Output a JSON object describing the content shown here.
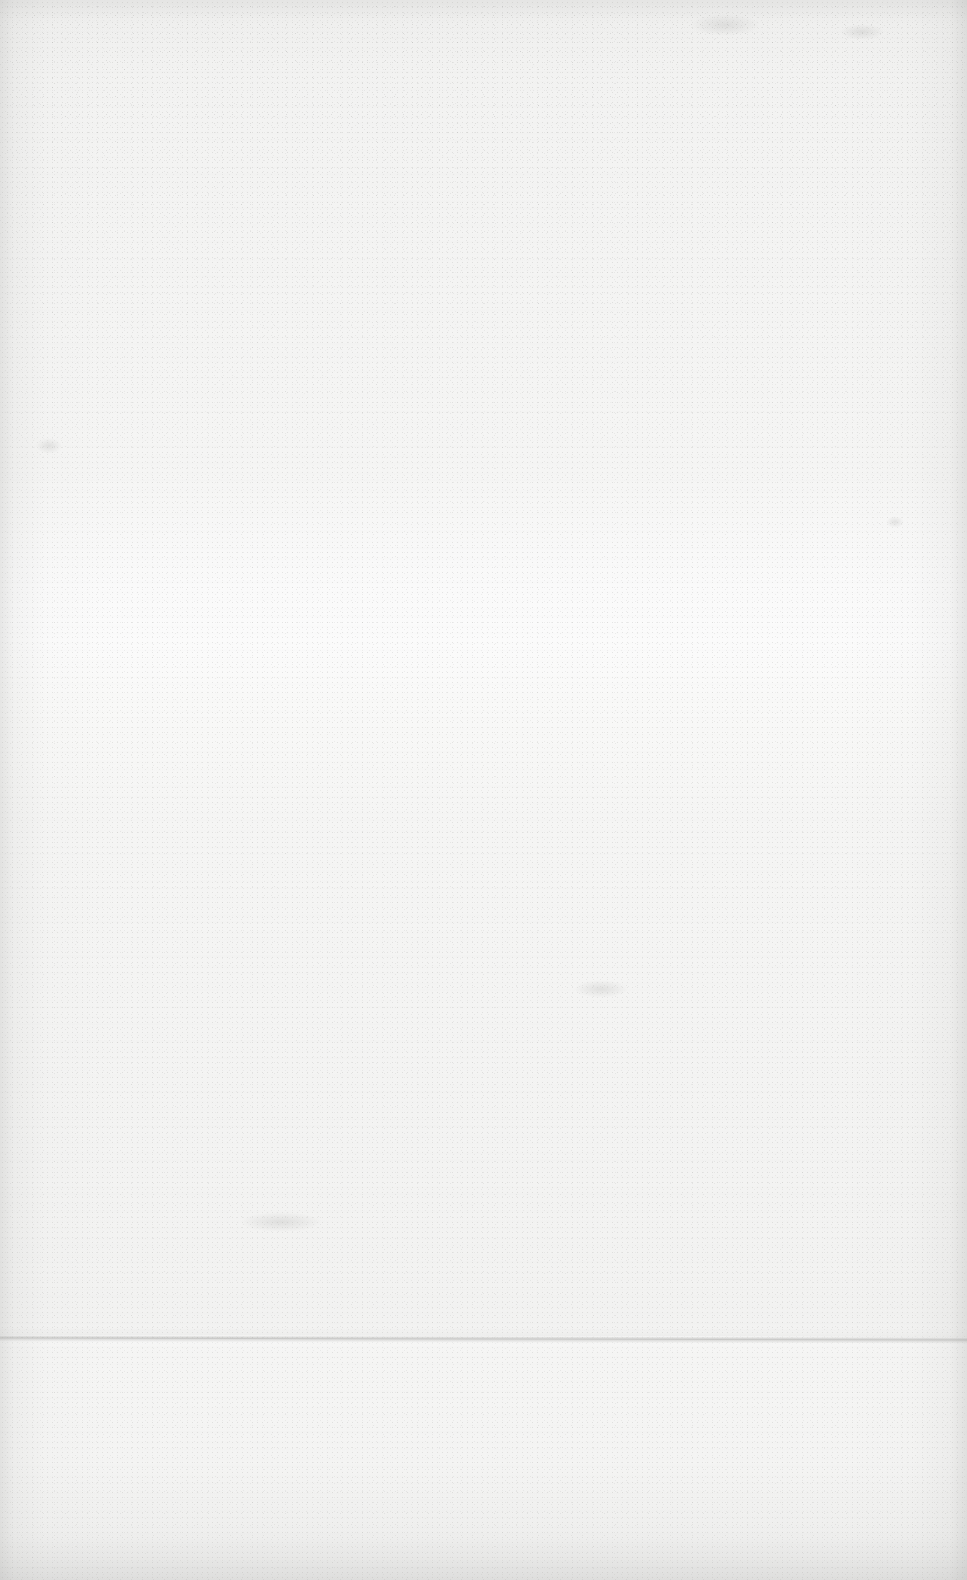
{
  "page": {
    "kind": "scanned-blank-page",
    "width": 967,
    "height": 1580,
    "visible_text": "",
    "has_text": false,
    "has_figures": false,
    "has_tables": false,
    "has_page_number": false,
    "colors": {
      "paper_base": "#f4f4f3",
      "paper_bright_band": "#fbfbfb",
      "paper_edge_shadow": "#a0a09e",
      "crease_line": "#7d7d7b",
      "grain_speck": "#78787 6"
    },
    "features": [
      {
        "name": "fold-crease",
        "type": "horizontal-line",
        "y": 1338,
        "x_start": 0,
        "x_end": 967,
        "note": "Faint fold crease spanning the full page width, sloping very slightly downward to the right."
      },
      {
        "name": "bright-band",
        "type": "horizontal-tonal-band",
        "y_start": 580,
        "y_end": 690,
        "note": "Lighter horizontal band across the sheet from scanner illumination."
      },
      {
        "name": "left-edge-shadow",
        "type": "vertical-vignette",
        "x_start": 0,
        "x_end": 46,
        "note": "Darker band along the left edge of the scan."
      },
      {
        "name": "right-edge-shadow",
        "type": "vertical-vignette",
        "x_start": 920,
        "x_end": 967,
        "note": "Darker band along the right edge of the scan."
      },
      {
        "name": "bottom-edge-shadow",
        "type": "horizontal-vignette",
        "y_start": 1535,
        "y_end": 1580,
        "note": "Grey shading along the bottom edge of the scan."
      },
      {
        "name": "top-speckle",
        "type": "speckle-cluster",
        "y_start": 0,
        "y_end": 540,
        "note": "Scattered darker specks and dust concentrated in the upper portion."
      }
    ]
  }
}
